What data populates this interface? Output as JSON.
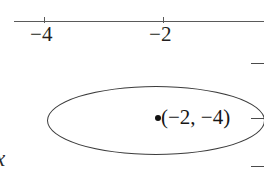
{
  "figure": {
    "kind": "cartesian-plane-fragment",
    "background_color": "#ffffff",
    "ink_color": "#231f20"
  },
  "x_axis": {
    "name": "x",
    "line_color": "#5a5a5a",
    "ticks": [
      {
        "value": -4,
        "label": "−4",
        "pixel_x": 44
      },
      {
        "value": -2,
        "label": "−2",
        "pixel_x": 163
      }
    ]
  },
  "y_axis": {
    "tick_stubs": [
      {
        "pixel_y": 63
      },
      {
        "pixel_y": 118
      },
      {
        "pixel_y": 166
      }
    ],
    "line_color": "#4a4a4a"
  },
  "shapes": {
    "ellipse": {
      "stroke_color": "#3c3c3c",
      "fill": "none"
    }
  },
  "annotations": {
    "point": {
      "marker": "filled-dot",
      "marker_color": "#111111",
      "label": "(−2, −4)",
      "x": -2,
      "y": -4
    }
  },
  "chart_data": {
    "type": "scatter",
    "title": "",
    "xlabel": "x",
    "ylabel": "",
    "grid": false,
    "legend": null,
    "xticks": [
      -4,
      -2
    ],
    "xtick_labels": [
      "−4",
      "−2"
    ],
    "yticks": [],
    "ytick_labels": [],
    "points": [
      {
        "x": -2,
        "y": -4,
        "label": "(−2, −4)"
      }
    ],
    "annotations": [
      {
        "type": "ellipse",
        "center_x": -2,
        "center_y": -4,
        "note": "ellipse centered on the plotted point, extends beyond right crop edge"
      }
    ]
  }
}
